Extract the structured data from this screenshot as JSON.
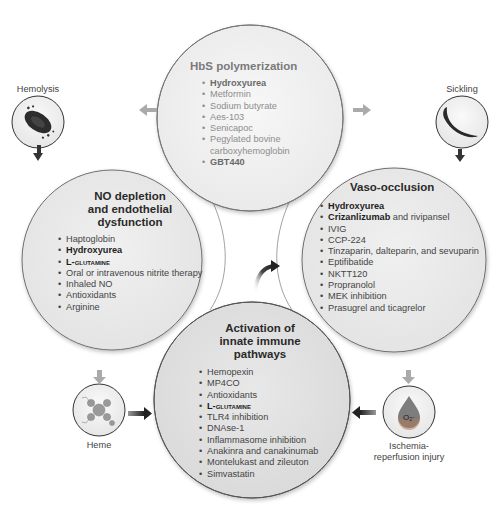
{
  "colors": {
    "circle_fill": "#ececec",
    "circle_fill_bottom": "#e2e2e2",
    "circle_stroke": "#6e6e6e",
    "lens_fill": "#c9c9c9",
    "arrow_dark": "#2b2b2b",
    "arrow_gray": "#a8a8a8"
  },
  "circles": {
    "top": {
      "title": "HbS polymerization",
      "style": "faded",
      "items": [
        {
          "lead": "Hydroxyurea",
          "rest": "",
          "bold": true
        },
        {
          "lead": "Metformin",
          "rest": "",
          "bold": false
        },
        {
          "lead": "Sodium butyrate",
          "rest": "",
          "bold": false
        },
        {
          "lead": "Aes-103",
          "rest": "",
          "bold": false
        },
        {
          "lead": "Senicapoc",
          "rest": "",
          "bold": false
        },
        {
          "lead": "Pegylated bovine",
          "rest": "carboxyhemoglobin",
          "bold": false
        },
        {
          "lead": "GBT440",
          "rest": "",
          "bold": true
        }
      ]
    },
    "left": {
      "title_lines": [
        "NO depletion",
        "and endothelial",
        "dysfunction"
      ],
      "items": [
        {
          "lead": "Haptoglobin",
          "rest": "",
          "bold": false
        },
        {
          "lead": "Hydroxyurea",
          "rest": "",
          "bold": true
        },
        {
          "lead": "L-glutamine",
          "rest": "",
          "bold": true
        },
        {
          "lead": "Oral or intravenous nitrite therapy",
          "rest": "",
          "bold": false
        },
        {
          "lead": "Inhaled NO",
          "rest": "",
          "bold": false
        },
        {
          "lead": "Antioxidants",
          "rest": "",
          "bold": false
        },
        {
          "lead": "Arginine",
          "rest": "",
          "bold": false
        }
      ]
    },
    "right": {
      "title": "Vaso-occlusion",
      "items": [
        {
          "lead": "Hydroxyurea",
          "rest": "",
          "bold": true
        },
        {
          "lead": "Crizanlizumab",
          "rest": " and rivipansel",
          "bold": true
        },
        {
          "lead": "IVIG",
          "rest": "",
          "bold": false
        },
        {
          "lead": "CCP-224",
          "rest": "",
          "bold": false
        },
        {
          "lead": "Tinzaparin, dalteparin, and sevuparin",
          "rest": "",
          "bold": false
        },
        {
          "lead": "Eptifibatide",
          "rest": "",
          "bold": false
        },
        {
          "lead": "NKTT120",
          "rest": "",
          "bold": false
        },
        {
          "lead": "Propranolol",
          "rest": "",
          "bold": false
        },
        {
          "lead": "MEK inhibition",
          "rest": "",
          "bold": false
        },
        {
          "lead": "Prasugrel and ticagrelor",
          "rest": "",
          "bold": false
        }
      ]
    },
    "bottom": {
      "title_lines": [
        "Activation of",
        "innate immune",
        "pathways"
      ],
      "items": [
        {
          "lead": "Hemopexin",
          "rest": "",
          "bold": false
        },
        {
          "lead": "MP4CO",
          "rest": "",
          "bold": false
        },
        {
          "lead": "Antioxidants",
          "rest": "",
          "bold": false
        },
        {
          "lead": "L-glutamine",
          "rest": "",
          "bold": true
        },
        {
          "lead": "TLR4 inhibition",
          "rest": "",
          "bold": false
        },
        {
          "lead": "DNAse-1",
          "rest": "",
          "bold": false
        },
        {
          "lead": "Inflammasome inhibition",
          "rest": "",
          "bold": false
        },
        {
          "lead": "Anakinra and canakinumab",
          "rest": "",
          "bold": false
        },
        {
          "lead": "Montelukast and zileuton",
          "rest": "",
          "bold": false
        },
        {
          "lead": "Simvastatin",
          "rest": "",
          "bold": false
        }
      ]
    }
  },
  "icons": {
    "hemolysis": {
      "label": "Hemolysis",
      "icon": "lysing-red-cell-icon"
    },
    "sickling": {
      "label": "Sickling",
      "icon": "sickle-cell-icon"
    },
    "heme": {
      "label": "Heme",
      "icon": "heme-molecule-icon"
    },
    "ischemia": {
      "label_lines": [
        "Ischemia-",
        "reperfusion injury"
      ],
      "icon": "oxygen-radical-drop-icon",
      "glyph": "O₂·"
    }
  }
}
